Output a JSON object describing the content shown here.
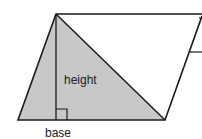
{
  "diagram": {
    "labels": {
      "height": "height",
      "base": "base"
    },
    "colors": {
      "stroke": "#1a1a1a",
      "triangle_fill": "#c8c8c8",
      "background": "#ffffff",
      "text": "#222222"
    },
    "shapes": {
      "parallelogram": "parallelogram",
      "shaded_triangle": "triangle",
      "height_line": "perpendicular height",
      "right_angle_marker": "right angle"
    }
  }
}
